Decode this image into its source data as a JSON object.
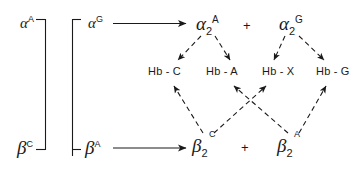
{
  "figure": {
    "name": "hemoglobin-chain-combination-diagram",
    "line_color": "#1a1a1a",
    "background": "#ffffff"
  },
  "left_bracket": {
    "alpha_locus": {
      "symbol": "α",
      "superscript": "A"
    },
    "beta_locus": {
      "symbol": "β",
      "superscript": "C"
    }
  },
  "right_bracket": {
    "alpha_locus": {
      "symbol": "α",
      "superscript": "G"
    },
    "beta_locus": {
      "symbol": "β",
      "superscript": "A"
    }
  },
  "dimers": {
    "alpha_left": {
      "symbol": "α",
      "subscript": "2",
      "superscript": "A"
    },
    "alpha_right": {
      "symbol": "α",
      "subscript": "2",
      "superscript": "G"
    },
    "beta_left": {
      "symbol": "β",
      "subscript": "2",
      "superscript": "C"
    },
    "beta_right": {
      "symbol": "β",
      "subscript": "2",
      "superscript": "A"
    },
    "plus_top": "+",
    "plus_bottom": "+"
  },
  "hemoglobins": [
    {
      "label": "Hb - C"
    },
    {
      "label": "Hb - A"
    },
    {
      "label": "Hb - X"
    },
    {
      "label": "Hb - G"
    }
  ]
}
